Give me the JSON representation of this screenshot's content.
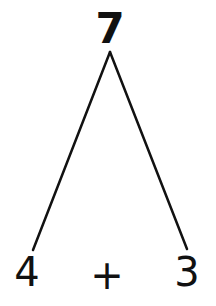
{
  "diagram": {
    "type": "number-bond",
    "whole": "7",
    "parts": [
      "4",
      "3"
    ],
    "operator": "+",
    "line_color": "#111111",
    "apex": {
      "x": 110,
      "y": 52
    },
    "left_end": {
      "x": 33,
      "y": 250
    },
    "right_end": {
      "x": 187,
      "y": 249
    }
  }
}
